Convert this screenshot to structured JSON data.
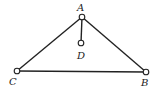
{
  "diagram": {
    "type": "mechanism-truss",
    "stroke_color": "#222222",
    "background": "#ffffff",
    "nodes": [
      {
        "id": "A",
        "label": "A",
        "x": 82,
        "y": 17,
        "label_x": 80,
        "label_y": 10
      },
      {
        "id": "D",
        "label": "D",
        "x": 81,
        "y": 43,
        "label_x": 81,
        "label_y": 57
      },
      {
        "id": "C",
        "label": "C",
        "x": 17,
        "y": 71,
        "label_x": 13,
        "label_y": 82
      },
      {
        "id": "B",
        "label": "B",
        "x": 146,
        "y": 72,
        "label_x": 145,
        "label_y": 84
      }
    ],
    "edges": [
      {
        "from": "A",
        "to": "C"
      },
      {
        "from": "A",
        "to": "B"
      },
      {
        "from": "C",
        "to": "B"
      },
      {
        "from": "A",
        "to": "D"
      }
    ]
  }
}
